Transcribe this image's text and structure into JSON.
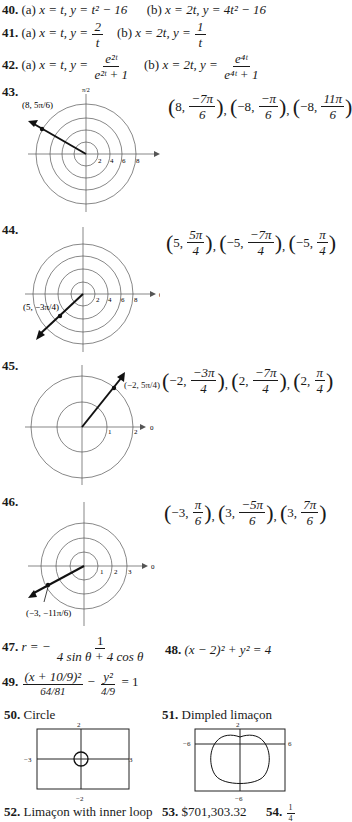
{
  "problems": {
    "p40": {
      "num": "40.",
      "a_label": "(a)",
      "a_expr": "x = t, y = t² − 16",
      "b_label": "(b)",
      "b_expr": "x = 2t, y = 4t² − 16"
    },
    "p41": {
      "num": "41.",
      "a_label": "(a)",
      "a_lhs": "x = t, y =",
      "a_num": "2",
      "a_den": "t",
      "b_label": "(b)",
      "b_lhs": "x = 2t, y =",
      "b_num": "1",
      "b_den": "t"
    },
    "p42": {
      "num": "42.",
      "a_label": "(a)",
      "a_lhs": "x = t, y =",
      "a_num": "e²ᵗ",
      "a_den": "e²ᵗ + 1",
      "b_label": "(b)",
      "b_lhs": "x = 2t, y =",
      "b_num": "e⁴ᵗ",
      "b_den": "e⁴ᵗ + 1"
    },
    "p43": {
      "num": "43.",
      "point_label": "(8, 5π/6)",
      "axis_top": "π/2",
      "axis_right": "0",
      "ticks": [
        "2",
        "4",
        "6",
        "8"
      ],
      "answers": [
        [
          "8",
          "−7π",
          "6"
        ],
        [
          "−8",
          "−π",
          "6"
        ],
        [
          "−8",
          "11π",
          "6"
        ]
      ]
    },
    "p44": {
      "num": "44.",
      "point_label": "(5, −3π/4)",
      "axis_top": "π/2",
      "axis_right": "0",
      "ticks": [
        "2",
        "4",
        "6",
        "8"
      ],
      "answers": [
        [
          "5",
          "5π",
          "4"
        ],
        [
          "−5",
          "−7π",
          "4"
        ],
        [
          "−5",
          "π",
          "4"
        ]
      ]
    },
    "p45": {
      "num": "45.",
      "point_label": "(−2, 5π/4)",
      "axis_top": "π/2",
      "axis_right": "0",
      "ticks": [
        "1",
        "2"
      ],
      "answers": [
        [
          "−2",
          "−3π",
          "4"
        ],
        [
          "2",
          "−7π",
          "4"
        ],
        [
          "2",
          "π",
          "4"
        ]
      ]
    },
    "p46": {
      "num": "46.",
      "point_label": "(−3, −11π/6)",
      "axis_top": "π/2",
      "axis_right": "0",
      "ticks": [
        "1",
        "2",
        "3"
      ],
      "answers": [
        [
          "−3",
          "π",
          "6"
        ],
        [
          "3",
          "−5π",
          "6"
        ],
        [
          "3",
          "7π",
          "6"
        ]
      ]
    },
    "p47": {
      "num": "47.",
      "lhs": "r = −",
      "num_text": "1",
      "den_text": "4 sin θ + 4 cos θ"
    },
    "p48": {
      "num": "48.",
      "expr": "(x − 2)² + y² = 4"
    },
    "p49": {
      "num": "49.",
      "t1_num": "(x + 10/9)²",
      "t1_den": "64/81",
      "minus": "−",
      "t2_num": "y²",
      "t2_den": "4/9",
      "rhs": "= 1"
    },
    "p50": {
      "num": "50.",
      "label": "Circle",
      "window": {
        "xmin": "−3",
        "xmax": "3",
        "ymin": "−2",
        "ymax": "2"
      }
    },
    "p51": {
      "num": "51.",
      "label": "Dimpled limaçon",
      "window": {
        "xmin": "−6",
        "xmax": "6",
        "ymin": "−6",
        "ymax": "2"
      }
    },
    "p52": {
      "num": "52.",
      "label": "Limaçon with inner loop"
    },
    "p53": {
      "num": "53.",
      "label": "$701,303.32"
    },
    "p54": {
      "num": "54.",
      "num_text": "1",
      "den_text": "4"
    }
  }
}
